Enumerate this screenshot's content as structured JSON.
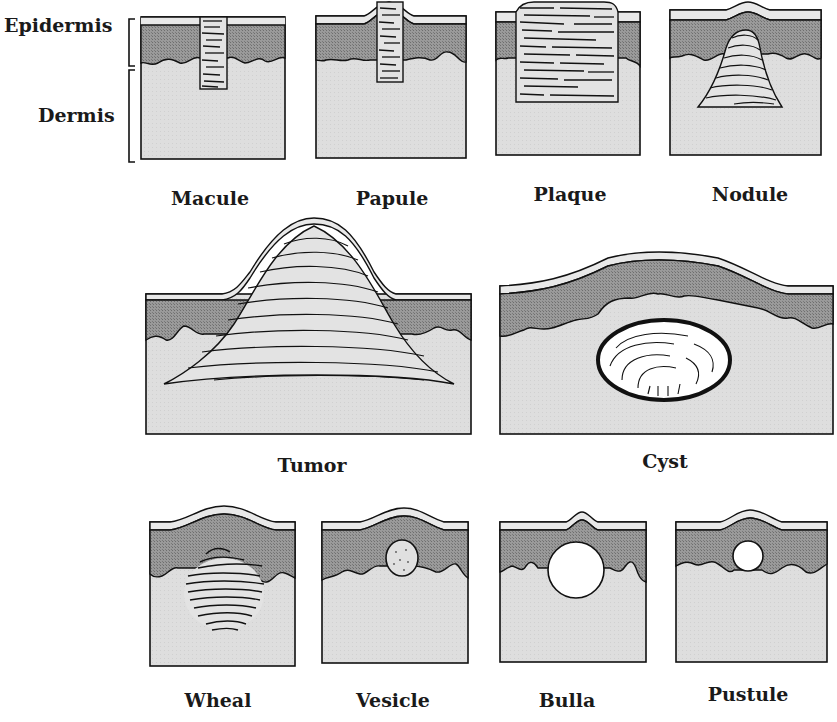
{
  "colors": {
    "dermis": "#dcdcdc",
    "epidermis": "#8f8f8f",
    "stratum": "#e6e6e6",
    "outline": "#111111",
    "fluid": "#ffffff"
  },
  "layer_labels": {
    "epidermis": "Epidermis",
    "dermis": "Dermis"
  },
  "lesions": [
    {
      "id": "macule",
      "label": "Macule"
    },
    {
      "id": "papule",
      "label": "Papule"
    },
    {
      "id": "plaque",
      "label": "Plaque"
    },
    {
      "id": "nodule",
      "label": "Nodule"
    },
    {
      "id": "tumor",
      "label": "Tumor"
    },
    {
      "id": "cyst",
      "label": "Cyst"
    },
    {
      "id": "wheal",
      "label": "Wheal"
    },
    {
      "id": "vesicle",
      "label": "Vesicle"
    },
    {
      "id": "bulla",
      "label": "Bulla"
    },
    {
      "id": "pustule",
      "label": "Pustule"
    }
  ]
}
